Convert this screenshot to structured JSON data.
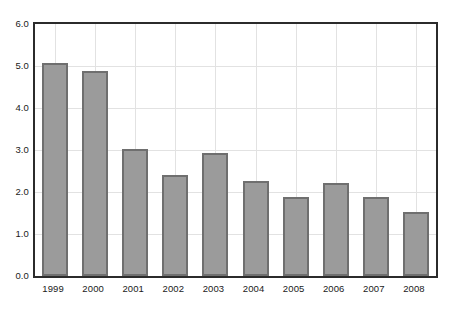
{
  "chart_data": {
    "type": "bar",
    "title": "",
    "subtitle": "",
    "xlabel": "",
    "ylabel": "",
    "categories": [
      "1999",
      "2000",
      "2001",
      "2002",
      "2003",
      "2004",
      "2005",
      "2006",
      "2007",
      "2008"
    ],
    "values": [
      5.08,
      4.87,
      3.03,
      2.41,
      2.92,
      2.26,
      1.87,
      2.21,
      1.88,
      1.53
    ],
    "series": [
      {
        "name": "",
        "values": [
          5.08,
          4.87,
          3.03,
          2.41,
          2.92,
          2.26,
          1.87,
          2.21,
          1.88,
          1.53
        ]
      }
    ],
    "ylim": [
      0.0,
      6.0
    ],
    "ytick_step": 1.0,
    "ytick_labels": [
      "0.0",
      "1.0",
      "2.0",
      "3.0",
      "4.0",
      "5.0",
      "6.0"
    ],
    "ytick_values": [
      0.0,
      1.0,
      2.0,
      3.0,
      4.0,
      5.0,
      6.0
    ],
    "xtick_labels": [
      "1999",
      "2000",
      "2001",
      "2002",
      "2003",
      "2004",
      "2005",
      "2006",
      "2007",
      "2008"
    ],
    "grid": true,
    "grid_axis": "both",
    "legend": false,
    "legend_position": "none",
    "annotations": [],
    "colors": {
      "bar_fill": "#9b9b9b",
      "bar_edge": "#6f6f6f",
      "grid": "#e2e2e2",
      "frame": "#2b2b2b",
      "background": "#ffffff",
      "tick_label": "#1a1a1a"
    }
  }
}
